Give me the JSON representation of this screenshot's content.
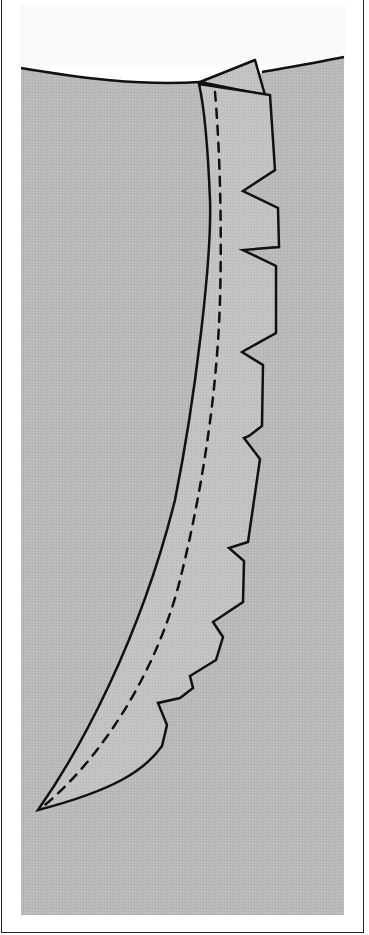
{
  "figure": {
    "title": "",
    "colors": {
      "background": "#ffffff",
      "fabric": "#b9b9b9",
      "seam_allowance": "#c4c4c4",
      "outline": "#111111",
      "frame": "#222222"
    },
    "elements": [
      {
        "name": "fabric-panel",
        "label": ""
      },
      {
        "name": "seam-allowance",
        "label": ""
      },
      {
        "name": "stitch-line",
        "label": "",
        "style": "dashed"
      },
      {
        "name": "notches",
        "count": 7
      }
    ]
  }
}
